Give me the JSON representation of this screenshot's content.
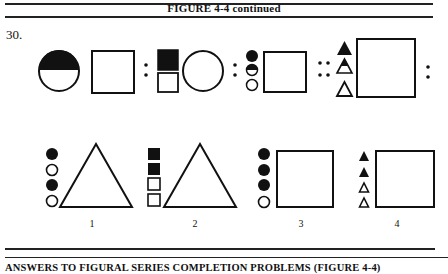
{
  "header": {
    "title": "FIGURE 4-4 continued"
  },
  "problem": {
    "number": "30.",
    "analogy": {
      "description": "Figural analogy: A : B :: C : ?",
      "terms": [
        {
          "id": "A1",
          "shape": "circle",
          "fill": "top-half-black",
          "paired_with": "square"
        },
        {
          "id": "A2",
          "shape": "stacked-squares",
          "fill": "top-black-bottom-white",
          "paired_with": "circle"
        },
        {
          "id": "B1",
          "shape": "stacked-circles",
          "fill": [
            "black",
            "half-black",
            "white"
          ],
          "paired_with": "square"
        },
        {
          "id": "B2",
          "shape": "stacked-triangles",
          "fill": [
            "black",
            "half-black",
            "white"
          ],
          "paired_with": "large-square"
        }
      ],
      "separators": [
        ":",
        ":",
        "::",
        ":"
      ]
    },
    "options": [
      {
        "label": "1",
        "small_shapes": "circles",
        "fills": [
          "black",
          "white",
          "black",
          "white"
        ],
        "large_shape": "triangle"
      },
      {
        "label": "2",
        "small_shapes": "squares",
        "fills": [
          "black",
          "black",
          "white",
          "white"
        ],
        "large_shape": "triangle"
      },
      {
        "label": "3",
        "small_shapes": "circles",
        "fills": [
          "black",
          "black",
          "black",
          "white"
        ],
        "large_shape": "square"
      },
      {
        "label": "4",
        "small_shapes": "triangles",
        "fills": [
          "black",
          "black",
          "white",
          "white"
        ],
        "large_shape": "square"
      }
    ]
  },
  "footer": {
    "title": "ANSWERS TO FIGURAL SERIES COMPLETION PROBLEMS (FIGURE 4-4)"
  },
  "colors": {
    "ink": "#111111",
    "paper": "#ffffff"
  }
}
